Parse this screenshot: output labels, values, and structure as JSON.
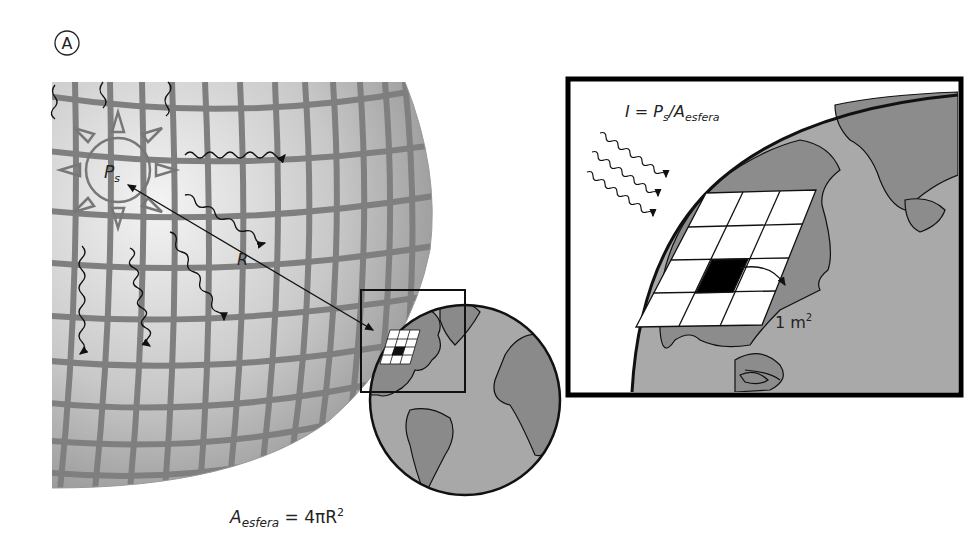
{
  "panel_label": "A",
  "left_panel": {
    "sun_label_main": "P",
    "sun_label_sub": "s",
    "radius_label": "R",
    "formula": {
      "lhs_main": "A",
      "lhs_sub": "esfera",
      "rhs_prefix": " = 4πR",
      "rhs_sup": "2"
    }
  },
  "inset_panel": {
    "formula": {
      "i": "I",
      "eq": " = P",
      "p_sub": "s",
      "slash": "/A",
      "a_sub": "esfera"
    },
    "area_label": "1 m",
    "area_sup": "2",
    "grid": {
      "rows": 4,
      "cols": 3,
      "highlighted_cell": [
        2,
        1
      ]
    }
  },
  "colors": {
    "sphere_light": "#e6e6e6",
    "sphere_dark": "#8a8a8a",
    "grid_lines": "#7a7a7a",
    "ocean": "#a9a9a9",
    "land": "#8c8c8c",
    "outline": "#111111",
    "frame": "#000000"
  }
}
